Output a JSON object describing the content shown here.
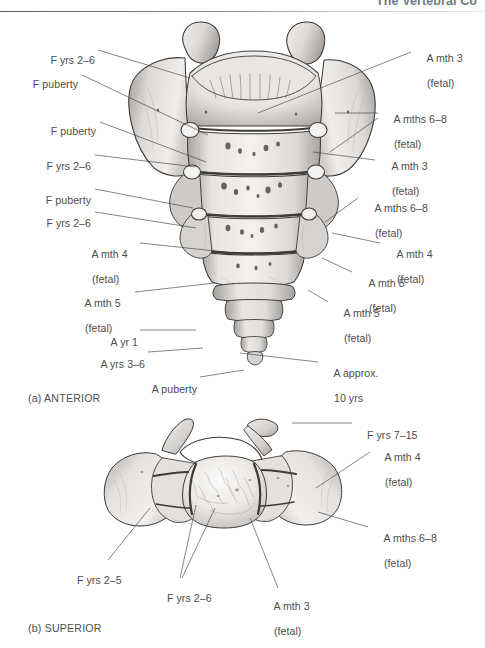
{
  "header": {
    "running_head": "The Vertebral Co"
  },
  "figure": {
    "panels": [
      {
        "id": "a",
        "caption": "(a) ANTERIOR"
      },
      {
        "id": "b",
        "caption": "(b) SUPERIOR"
      }
    ]
  },
  "anterior": {
    "labels_left": [
      {
        "id": "a-l1",
        "line1": "F yrs 2–6",
        "line2": ""
      },
      {
        "id": "a-l2",
        "line1": "F puberty",
        "line2": ""
      },
      {
        "id": "a-l3",
        "line1": "F puberty",
        "line2": ""
      },
      {
        "id": "a-l4",
        "line1": "F yrs 2–6",
        "line2": ""
      },
      {
        "id": "a-l5",
        "line1": "F puberty",
        "line2": ""
      },
      {
        "id": "a-l6",
        "line1": "F yrs 2–6",
        "line2": ""
      },
      {
        "id": "a-l7",
        "line1": "A mth 4",
        "line2": "(fetal)"
      },
      {
        "id": "a-l8",
        "line1": "A mth 5",
        "line2": "(fetal)"
      },
      {
        "id": "a-l9",
        "line1": "A yr 1",
        "line2": ""
      },
      {
        "id": "a-l10",
        "line1": "A yrs 3–6",
        "line2": ""
      },
      {
        "id": "a-l11",
        "line1": "A puberty",
        "line2": ""
      }
    ],
    "labels_right": [
      {
        "id": "a-r1",
        "line1": "A mth 3",
        "line2": "(fetal)"
      },
      {
        "id": "a-r2",
        "line1": "A mths 6–8",
        "line2": "(fetal)"
      },
      {
        "id": "a-r3",
        "line1": "A mth 3",
        "line2": "(fetal)"
      },
      {
        "id": "a-r4",
        "line1": "A mths 6–8",
        "line2": "(fetal)"
      },
      {
        "id": "a-r5",
        "line1": "A mth 4",
        "line2": "(fetal)"
      },
      {
        "id": "a-r6",
        "line1": "A mth 5",
        "line2": "(fetal)"
      },
      {
        "id": "a-r7",
        "line1": "A mth 5",
        "line2": "(fetal)"
      },
      {
        "id": "a-r8",
        "line1": "A approx.",
        "line2": "10 yrs"
      }
    ]
  },
  "superior": {
    "labels_right": [
      {
        "id": "b-r1",
        "line1": "F yrs 7–15",
        "line2": ""
      },
      {
        "id": "b-r2",
        "line1": "A mth 4",
        "line2": "(fetal)"
      },
      {
        "id": "b-r3",
        "line1": "A mths 6–8",
        "line2": "(fetal)"
      }
    ],
    "labels_bottom": [
      {
        "id": "b-b1",
        "line1": "F yrs 2–5",
        "line2": ""
      },
      {
        "id": "b-b2",
        "line1": "F yrs 2–6",
        "line2": ""
      },
      {
        "id": "b-b3",
        "line1": "A mth 3",
        "line2": "(fetal)"
      }
    ]
  },
  "colors": {
    "text": "#4d4d4d",
    "header_text": "#6f7b86",
    "leader": "#3a3a3a",
    "bone_light": "#f2f0ee",
    "bone_mid": "#d3cfcb",
    "bone_shadow": "#a09b96",
    "outline": "#3d3a37",
    "background": "#ffffff"
  }
}
